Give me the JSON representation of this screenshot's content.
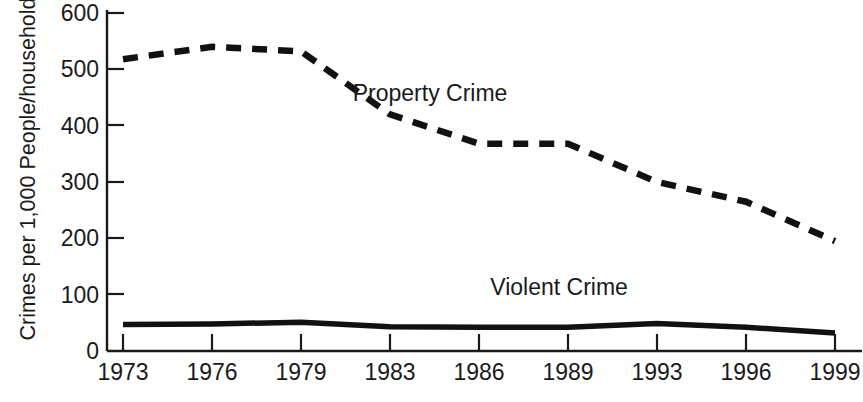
{
  "chart_data": {
    "type": "line",
    "title": "",
    "xlabel": "",
    "ylabel": "Crimes per 1,000 People/households",
    "categories": [
      "1973",
      "1976",
      "1979",
      "1983",
      "1986",
      "1989",
      "1993",
      "1996",
      "1999"
    ],
    "ylim": [
      0,
      600
    ],
    "yticks": [
      0,
      100,
      200,
      300,
      400,
      500,
      600
    ],
    "ytick_labels": [
      "0",
      "100",
      "200",
      "300",
      "400",
      "500",
      "600"
    ],
    "grid": false,
    "legend_position": "inline-annotation",
    "series": [
      {
        "name": "Property Crime",
        "style": "dashed",
        "color": "#111111",
        "values": [
          518,
          540,
          532,
          420,
          368,
          368,
          300,
          265,
          195
        ],
        "label_x_category_index": 3.45,
        "label_y_value": 455
      },
      {
        "name": "Violent Crime",
        "style": "solid",
        "color": "#111111",
        "values": [
          47,
          48,
          51,
          43,
          42,
          42,
          49,
          42,
          32
        ],
        "label_x_category_index": 4.9,
        "label_y_value": 110
      }
    ],
    "annotations": [
      {
        "text": "Property Crime",
        "series": "Property Crime"
      },
      {
        "text": "Violent Crime",
        "series": "Violent Crime"
      }
    ]
  },
  "axes": {
    "x_tick_labels": [
      "1973",
      "1976",
      "1979",
      "1983",
      "1986",
      "1989",
      "1993",
      "1996",
      "1999"
    ],
    "y_tick_labels": [
      "600",
      "500",
      "400",
      "300",
      "200",
      "100",
      "0"
    ],
    "y_axis_title": "Crimes per 1,000 People/households"
  }
}
